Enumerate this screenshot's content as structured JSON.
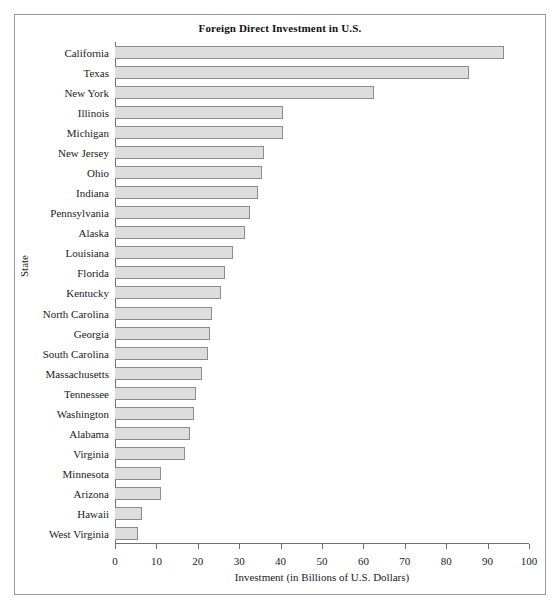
{
  "chart_data": {
    "type": "bar",
    "orientation": "horizontal",
    "title": "Foreign Direct Investment in U.S.",
    "xlabel": "Investment (in Billions of U.S. Dollars)",
    "ylabel": "State",
    "xlim": [
      0,
      100
    ],
    "xticks": [
      0,
      10,
      20,
      30,
      40,
      50,
      60,
      70,
      80,
      90,
      100
    ],
    "xtick_labels": [
      "0",
      "10",
      "20",
      "30",
      "40",
      "50",
      "60",
      "70",
      "80",
      "90",
      "100"
    ],
    "grid": false,
    "legend": false,
    "bar_fill_color": "#dddddd",
    "bar_border_color": "#8c8c8c",
    "categories": [
      "California",
      "Texas",
      "New York",
      "Illinois",
      "Michigan",
      "New Jersey",
      "Ohio",
      "Indiana",
      "Pennsylvania",
      "Alaska",
      "Louisiana",
      "Florida",
      "Kentucky",
      "North Carolina",
      "Georgia",
      "South Carolina",
      "Massachusetts",
      "Tennessee",
      "Washington",
      "Alabama",
      "Virginia",
      "Minnesota",
      "Arizona",
      "Hawaii",
      "West Virginia"
    ],
    "values": [
      94,
      85.5,
      62.5,
      40.5,
      40.5,
      36,
      35.5,
      34.5,
      32.5,
      31.5,
      28.5,
      26.5,
      25.5,
      23.5,
      23,
      22.5,
      21,
      19.5,
      19,
      18,
      17,
      11,
      11,
      6.5,
      5.5
    ]
  }
}
